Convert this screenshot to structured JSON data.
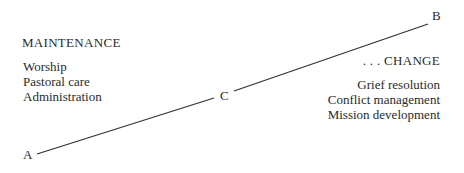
{
  "diagram": {
    "left": {
      "heading": "MAINTENANCE",
      "items": [
        "Worship",
        "Pastoral care",
        "Administration"
      ]
    },
    "right": {
      "heading": ". . . CHANGE",
      "items": [
        "Grief resolution",
        "Conflict management",
        "Mission development"
      ]
    },
    "points": {
      "a": "A",
      "b": "B",
      "c": "C"
    },
    "line_color": "#333333"
  }
}
